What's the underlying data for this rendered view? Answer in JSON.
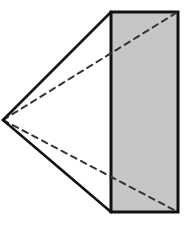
{
  "diagram": {
    "type": "geometry-figure",
    "apex": {
      "x": 3,
      "y": 120
    },
    "rectangle": {
      "x": 111,
      "y": 12,
      "width": 67,
      "height": 200
    },
    "solid_edges": [
      {
        "from": "apex",
        "to": "rect-top-left"
      },
      {
        "from": "apex",
        "to": "rect-bottom-left"
      }
    ],
    "dashed_edges": [
      {
        "from": "apex",
        "to": "rect-top-right"
      },
      {
        "from": "apex",
        "to": "rect-bottom-right"
      }
    ],
    "colors": {
      "stroke": "#111111",
      "dash": "#333333",
      "fill": "#c6c6c6",
      "background": "#ffffff"
    }
  }
}
